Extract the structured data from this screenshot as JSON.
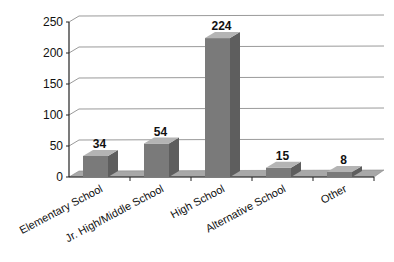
{
  "chart_data": {
    "type": "bar",
    "style": "3d-column",
    "title": "",
    "xlabel": "",
    "ylabel": "",
    "categories": [
      "Elementary School",
      "Jr. High/Middle School",
      "High School",
      "Alternative School",
      "Other"
    ],
    "values": [
      34,
      54,
      224,
      15,
      8
    ],
    "data_labels": [
      "34",
      "54",
      "224",
      "15",
      "8"
    ],
    "ylim": [
      0,
      250
    ],
    "yticks": [
      0,
      50,
      100,
      150,
      200,
      250
    ],
    "ytick_labels": [
      "0",
      "50",
      "100",
      "150",
      "200",
      "250"
    ],
    "grid": true,
    "legend": null,
    "colors": {
      "bar_front": "#7a7a7a",
      "bar_side": "#5e5e5e",
      "bar_top": "#b4b4b4",
      "floor": "#a8a8a8",
      "grid": "#9a9a9a",
      "axis": "#222222",
      "text": "#111111"
    }
  }
}
